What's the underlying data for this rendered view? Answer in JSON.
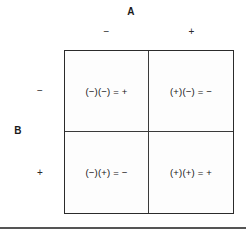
{
  "chart_data": {
    "type": "table",
    "xlabel": "A",
    "ylabel": "B",
    "col_headers": [
      "−",
      "+"
    ],
    "row_headers": [
      "−",
      "+"
    ],
    "grid": [
      [
        "(−)(−) = +",
        "(+)(−) = −"
      ],
      [
        "(−)(+) = −",
        "(+)(+) = +"
      ]
    ],
    "cells": [
      {
        "row": "−",
        "col": "−",
        "text": "(−)(−) = +",
        "result": "+"
      },
      {
        "row": "−",
        "col": "+",
        "text": "(+)(−) = −",
        "result": "−"
      },
      {
        "row": "+",
        "col": "−",
        "text": "(−)(+) = −",
        "result": "−"
      },
      {
        "row": "+",
        "col": "+",
        "text": "(+)(+) = +",
        "result": "+"
      }
    ],
    "grid_on": true,
    "legend_position": "none"
  },
  "axes": {
    "column": {
      "title": "A",
      "neg_label": "−",
      "pos_label": "+"
    },
    "row": {
      "title": "B",
      "neg_label": "−",
      "pos_label": "+"
    }
  },
  "cells": {
    "neg_neg": "(−)(−) = +",
    "pos_neg": "(+)(−) = −",
    "neg_pos": "(−)(+) = −",
    "pos_pos": "(+)(+) = +"
  },
  "colors": {
    "background": "#ffffff",
    "text": "#141414",
    "border": "#2b2b2b",
    "divider": "#3a3a3a",
    "rule": "#555555"
  }
}
